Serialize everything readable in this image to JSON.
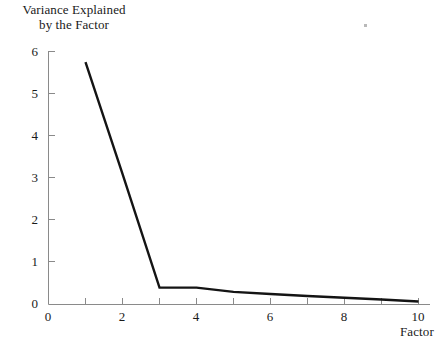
{
  "chart_data": {
    "type": "line",
    "title": "",
    "subtitle": "",
    "xlabel": "Factor",
    "ylabel": "Variance Explained by the Factor",
    "ylabel_lines": [
      "Variance Explained",
      "by the Factor"
    ],
    "x": [
      1,
      2,
      3,
      4,
      5,
      6,
      7,
      8,
      9,
      10
    ],
    "values": [
      5.75,
      3.1,
      0.4,
      0.4,
      0.3,
      0.25,
      0.2,
      0.16,
      0.12,
      0.07
    ],
    "series": [
      {
        "name": "Variance Explained",
        "values": [
          5.75,
          3.1,
          0.4,
          0.4,
          0.3,
          0.25,
          0.2,
          0.16,
          0.12,
          0.07
        ]
      }
    ],
    "xlim": [
      0,
      10
    ],
    "ylim": [
      0,
      6
    ],
    "x_ticks": [
      0,
      2,
      4,
      6,
      8,
      10
    ],
    "x_minor_ticks": [
      1,
      3,
      5,
      7,
      9
    ],
    "y_ticks": [
      0,
      1,
      2,
      3,
      4,
      5,
      6
    ],
    "x_tick_labels": [
      "0",
      "2",
      "4",
      "6",
      "8",
      "10"
    ],
    "y_tick_labels": [
      "0",
      "1",
      "2",
      "3",
      "4",
      "5",
      "6"
    ],
    "grid": false,
    "legend": false,
    "legend_position": "none",
    "line_color": "#141414",
    "axis_color": "#8a8a8a",
    "background": "#ffffff"
  },
  "marks": {
    "speck_name": "page-speck"
  }
}
